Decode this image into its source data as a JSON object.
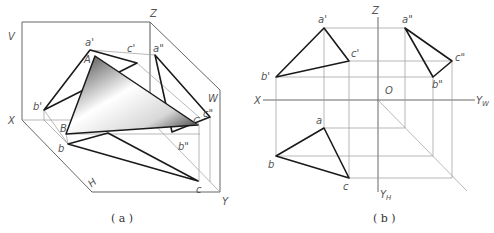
{
  "figure_a": {
    "caption": "( a )",
    "labels": {
      "V": "V",
      "Z": "Z",
      "W": "W",
      "X": "X",
      "Y": "Y",
      "H": "H",
      "a_prime": "a'",
      "c_prime": "c'",
      "a_dprime": "a\"",
      "b_prime": "b'",
      "c_dprime": "c\"",
      "b_dprime": "b\"",
      "A": "A",
      "B": "B",
      "C": "C",
      "b": "b",
      "c": "c"
    }
  },
  "figure_b": {
    "caption": "( b )",
    "labels": {
      "Z": "Z",
      "X": "X",
      "O": "O",
      "YW": "Y",
      "YW_sub": "W",
      "YH": "Y",
      "YH_sub": "H",
      "a_prime": "a'",
      "b_prime": "b'",
      "c_prime": "c'",
      "a_dprime": "a\"",
      "b_dprime": "b\"",
      "c_dprime": "c\"",
      "a": "a",
      "b": "b",
      "c": "c"
    }
  }
}
